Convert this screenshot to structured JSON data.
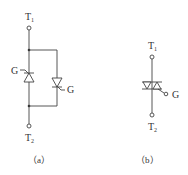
{
  "diagram": {
    "stroke_color": "#444444",
    "panel_a": {
      "caption": "（a）",
      "terminal_top": {
        "label": "T",
        "subscript": "1"
      },
      "terminal_bottom": {
        "label": "T",
        "subscript": "2"
      },
      "left_thyristor": {
        "gate_label": "G",
        "direction": "up"
      },
      "right_thyristor": {
        "gate_label": "G",
        "direction": "down"
      }
    },
    "panel_b": {
      "caption": "（b）",
      "terminal_top": {
        "label": "T",
        "subscript": "1"
      },
      "terminal_bottom": {
        "label": "T",
        "subscript": "2"
      },
      "gate_label": "G"
    }
  }
}
